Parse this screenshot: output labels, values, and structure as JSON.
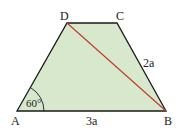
{
  "diagram": {
    "type": "trapezoid",
    "colors": {
      "fill": "#d8e8cd",
      "stroke": "#1a1a1a",
      "diagonal": "#c0392b",
      "text": "#222222"
    },
    "vertices": {
      "A": {
        "label": "A",
        "x": 17,
        "y": 111
      },
      "B": {
        "label": "B",
        "x": 166,
        "y": 111
      },
      "C": {
        "label": "C",
        "x": 117,
        "y": 23
      },
      "D": {
        "label": "D",
        "x": 67,
        "y": 23
      }
    },
    "diagonal": {
      "from": "D",
      "to": "B"
    },
    "side_labels": {
      "AB": "3a",
      "BC": "2a"
    },
    "angle_label": "60°"
  }
}
